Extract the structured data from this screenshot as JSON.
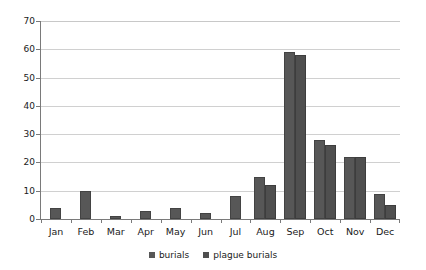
{
  "chart_data": {
    "type": "bar",
    "title": "",
    "subtitle": "",
    "xlabel": "",
    "ylabel": "",
    "ylim": [
      0,
      70
    ],
    "ytick_step": 10,
    "yticks": [
      70,
      60,
      50,
      40,
      30,
      20,
      10,
      0
    ],
    "grid": true,
    "grid_axis": "y",
    "legend_position": "bottom-center",
    "categories": [
      "Jan",
      "Feb",
      "Mar",
      "Apr",
      "May",
      "Jun",
      "Jul",
      "Aug",
      "Sep",
      "Oct",
      "Nov",
      "Dec"
    ],
    "series": [
      {
        "name": "burials",
        "color": "#575757",
        "values": [
          4,
          10,
          1,
          3,
          4,
          2,
          8,
          15,
          59,
          28,
          22,
          9
        ]
      },
      {
        "name": "plague burials",
        "color": "#4f4f4f",
        "values": [
          0,
          0,
          0,
          0,
          0,
          0,
          0,
          12,
          58,
          26,
          22,
          5
        ]
      }
    ]
  },
  "legend": {
    "items": [
      {
        "label": "burials"
      },
      {
        "label": "plague burials"
      }
    ]
  },
  "colors": {
    "series_a": "#575757",
    "series_b": "#4f4f4f",
    "grid": "#d0d0d0",
    "axis": "#7a7a7a",
    "background": "#ffffff",
    "text": "#1a1a1a"
  }
}
